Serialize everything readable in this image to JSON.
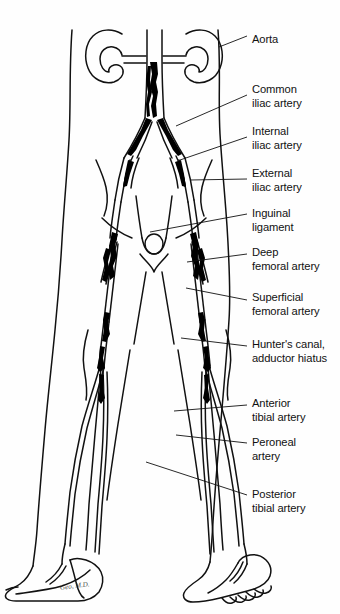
{
  "figure": {
    "colors": {
      "background": "#fefefe",
      "ink": "#111111",
      "plaque": "#000000"
    },
    "signature": "Geo, M.D."
  },
  "labels": [
    {
      "id": "aorta",
      "line1": "Aorta",
      "line2": "",
      "x": 252,
      "y": 32,
      "leader": {
        "x1": 219,
        "y1": 47,
        "x2": 247,
        "y2": 36
      }
    },
    {
      "id": "common-iliac",
      "line1": "Common",
      "line2": "iliac artery",
      "x": 252,
      "y": 82,
      "leader": {
        "x1": 176,
        "y1": 126,
        "x2": 247,
        "y2": 95
      }
    },
    {
      "id": "internal-iliac",
      "line1": "Internal",
      "line2": "iliac artery",
      "x": 252,
      "y": 124,
      "leader": {
        "x1": 180,
        "y1": 160,
        "x2": 247,
        "y2": 137
      }
    },
    {
      "id": "external-iliac",
      "line1": "External",
      "line2": "iliac artery",
      "x": 252,
      "y": 166,
      "leader": {
        "x1": 190,
        "y1": 180,
        "x2": 247,
        "y2": 179
      }
    },
    {
      "id": "inguinal-ligament",
      "line1": "Inguinal",
      "line2": "ligament",
      "x": 252,
      "y": 206,
      "leader": {
        "x1": 150,
        "y1": 232,
        "x2": 247,
        "y2": 214
      }
    },
    {
      "id": "deep-femoral",
      "line1": "Deep",
      "line2": "femoral artery",
      "x": 252,
      "y": 245,
      "leader": {
        "x1": 187,
        "y1": 262,
        "x2": 247,
        "y2": 254
      }
    },
    {
      "id": "superficial-femoral",
      "line1": "Superficial",
      "line2": "femoral artery",
      "x": 252,
      "y": 290,
      "leader": {
        "x1": 186,
        "y1": 288,
        "x2": 247,
        "y2": 300
      }
    },
    {
      "id": "hunters-canal",
      "line1": "Hunter's canal,",
      "line2": "adductor hiatus",
      "x": 252,
      "y": 337,
      "leader": {
        "x1": 181,
        "y1": 338,
        "x2": 247,
        "y2": 346
      }
    },
    {
      "id": "anterior-tibial",
      "line1": "Anterior",
      "line2": "tibial artery",
      "x": 252,
      "y": 396,
      "leader": {
        "x1": 174,
        "y1": 411,
        "x2": 247,
        "y2": 405
      }
    },
    {
      "id": "peroneal",
      "line1": "Peroneal",
      "line2": "artery",
      "x": 252,
      "y": 435,
      "leader": {
        "x1": 176,
        "y1": 435,
        "x2": 247,
        "y2": 443
      }
    },
    {
      "id": "posterior-tibial",
      "line1": "Posterior",
      "line2": "tibial artery",
      "x": 252,
      "y": 487,
      "leader": {
        "x1": 146,
        "y1": 462,
        "x2": 247,
        "y2": 495
      }
    }
  ]
}
